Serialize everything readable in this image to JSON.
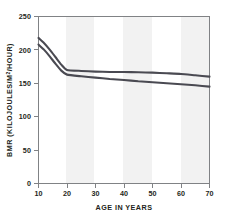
{
  "chart_data": {
    "type": "line",
    "title": "",
    "xlabel": "AGE IN YEARS",
    "ylabel": "BMR (KILOJOULES/M²/HOUR)",
    "ylabel_main": "BMR (KILOJOULES/M",
    "ylabel_sup": "2",
    "ylabel_tail": "/HOUR)",
    "xlim": [
      10,
      70
    ],
    "ylim": [
      0,
      250
    ],
    "xticks": [
      10,
      20,
      30,
      40,
      50,
      60,
      70
    ],
    "yticks": [
      0,
      50,
      100,
      150,
      200,
      250
    ],
    "xtick_labels": [
      "10",
      "20",
      "30",
      "40",
      "50",
      "60",
      "70"
    ],
    "ytick_labels": [
      "0",
      "50",
      "100",
      "150",
      "200",
      "250"
    ],
    "grid": false,
    "legend": "none",
    "background_bands": true,
    "line_color": "#4a4a52",
    "band_color": "#f2f2f2",
    "frame_color": "#808285",
    "x": [
      10,
      12,
      14,
      16,
      18,
      20,
      25,
      30,
      35,
      40,
      45,
      50,
      55,
      60,
      65,
      70
    ],
    "series": [
      {
        "name": "upper-curve",
        "values": [
          218,
          210,
          200,
          189,
          178,
          170,
          168.5,
          167.5,
          167,
          167,
          166.5,
          166,
          165,
          164,
          162,
          160
        ]
      },
      {
        "name": "lower-curve",
        "values": [
          208,
          200,
          190,
          179,
          169,
          163,
          160.5,
          158.5,
          156.5,
          155,
          153,
          151.5,
          150,
          148.5,
          147,
          145
        ]
      }
    ]
  }
}
